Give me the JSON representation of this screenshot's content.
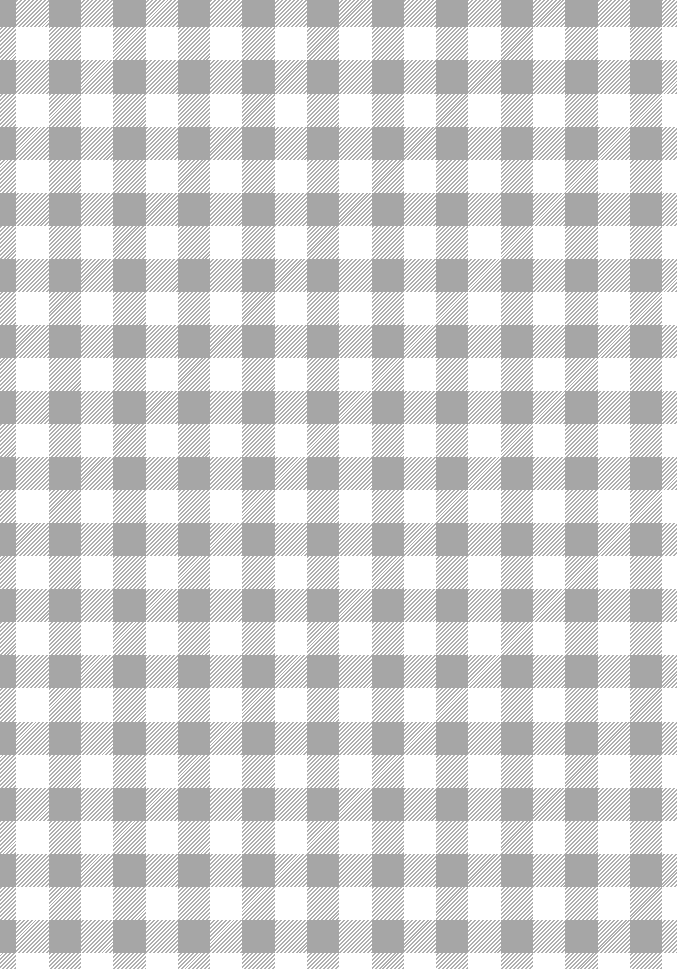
{
  "pattern": {
    "type": "gingham-check",
    "colors": {
      "background": "#ffffff",
      "solid_crossing": "#a6a6a6",
      "hatch_stripe": "#a0a0a0"
    },
    "hatch_direction": "diagonal-bottom-left-to-top-right",
    "column_period_px": 64.6,
    "row_period_px": 66.1,
    "white_column_width_px": 32,
    "white_row_height_px": 33
  }
}
